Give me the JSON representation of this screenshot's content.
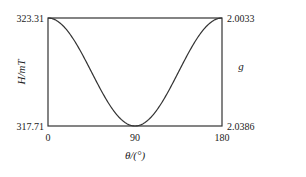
{
  "chart_data": {
    "type": "line",
    "title": "",
    "xlabel": "θ/(°)",
    "ylabel_left": "H/mT",
    "ylabel_right": "g",
    "xlim": [
      0,
      180
    ],
    "ylim_left": [
      317.71,
      323.31
    ],
    "ylim_right_top": 2.0033,
    "ylim_right_bottom": 2.0386,
    "x_ticks": [
      "0",
      "90",
      "180"
    ],
    "y_left_ticks": [
      "323.31",
      "317.71"
    ],
    "y_right_ticks": [
      "2.0033",
      "2.0386"
    ],
    "grid": false,
    "legend": false,
    "series": [
      {
        "name": "H",
        "x": [
          0,
          15,
          30,
          45,
          60,
          75,
          90,
          105,
          120,
          135,
          150,
          165,
          180
        ],
        "values": [
          323.31,
          323.12,
          322.61,
          321.91,
          320.91,
          318.09,
          317.71,
          318.09,
          320.91,
          321.91,
          322.61,
          323.12,
          323.31
        ]
      }
    ]
  },
  "labels": {
    "x0": "0",
    "x90": "90",
    "x180": "180",
    "yl_top": "323.31",
    "yl_bot": "317.71",
    "yr_top": "2.0033",
    "yr_bot": "2.0386",
    "ylabel_left": "H/mT",
    "ylabel_right": "g",
    "xlabel": "θ/(°)"
  }
}
